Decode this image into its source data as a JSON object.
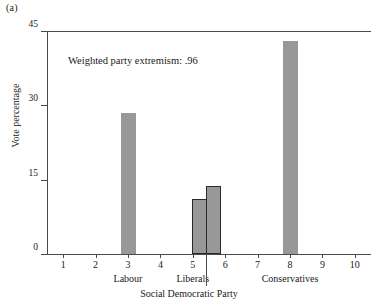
{
  "panel": {
    "label": "(a)"
  },
  "annotation": {
    "text": "Weighted party extremism: .96"
  },
  "axes": {
    "y": {
      "title": "Vote percentage",
      "ticks": [
        "0",
        "15",
        "30",
        "45"
      ],
      "min": 0,
      "max": 45
    },
    "x": {
      "ticks": [
        "1",
        "2",
        "3",
        "4",
        "5",
        "6",
        "7",
        "8",
        "9",
        "10"
      ],
      "min": 0.5,
      "max": 10.5
    }
  },
  "pointer": {
    "label": "Social Democratic Party",
    "points_to": 5.4
  },
  "party_labels": [
    {
      "name": "Labour",
      "x": 3
    },
    {
      "name": "Liberals",
      "x": 5
    },
    {
      "name": "Conservatives",
      "x": 8
    }
  ],
  "colors": {
    "bar_fill": "#989898",
    "bar_outline": "#2b2b2b",
    "axis": "#4a4a4a",
    "text": "#1a1a1a",
    "background": "#ffffff"
  },
  "chart_data": {
    "type": "bar",
    "title": "",
    "subtitle": "",
    "xlabel": "",
    "ylabel": "Vote percentage",
    "xlim": [
      0.5,
      10.5
    ],
    "ylim": [
      0,
      45
    ],
    "grid": false,
    "legend": "none",
    "annotations": [
      {
        "text": "Weighted party extremism: .96",
        "x": 2.2,
        "y": 40
      },
      {
        "text": "Social Democratic Party",
        "x": 5.4,
        "y": 0,
        "type": "pointer"
      }
    ],
    "categories": [
      "Labour",
      "Liberals",
      "Social Democratic Party",
      "Conservatives"
    ],
    "x": [
      3.0,
      5.2,
      5.65,
      8.0
    ],
    "values": [
      28.5,
      11.0,
      13.7,
      43.0
    ],
    "series": [
      {
        "name": "Vote percentage",
        "values": [
          28.5,
          11.0,
          13.7,
          43.0
        ]
      }
    ],
    "bars": [
      {
        "label": "Labour",
        "position": 3.0,
        "value": 28.5,
        "outlined": false
      },
      {
        "label": "Liberals",
        "position": 5.2,
        "value": 11.0,
        "outlined": true
      },
      {
        "label": "Social Democratic Party",
        "position": 5.65,
        "value": 13.7,
        "outlined": true
      },
      {
        "label": "Conservatives",
        "position": 8.0,
        "value": 43.0,
        "outlined": false
      }
    ]
  }
}
